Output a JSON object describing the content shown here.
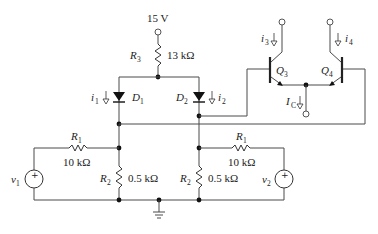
{
  "diagram": {
    "type": "circuit-schematic",
    "supply": {
      "label": "15 V"
    },
    "resistors": {
      "r3": {
        "name": "R",
        "sub": "3",
        "value": "13 kΩ"
      },
      "r1_left": {
        "name": "R",
        "sub": "1",
        "value": "10 kΩ"
      },
      "r1_right": {
        "name": "R",
        "sub": "1",
        "value": "10 kΩ"
      },
      "r2_left": {
        "name": "R",
        "sub": "2",
        "value": "0.5 kΩ"
      },
      "r2_right": {
        "name": "R",
        "sub": "2",
        "value": "0.5 kΩ"
      }
    },
    "diodes": {
      "d1": {
        "name": "D",
        "sub": "1"
      },
      "d2": {
        "name": "D",
        "sub": "2"
      }
    },
    "transistors": {
      "q3": {
        "name": "Q",
        "sub": "3"
      },
      "q4": {
        "name": "Q",
        "sub": "4"
      }
    },
    "currents": {
      "i1": {
        "name": "i",
        "sub": "1"
      },
      "i2": {
        "name": "i",
        "sub": "2"
      },
      "i3": {
        "name": "i",
        "sub": "3"
      },
      "i4": {
        "name": "i",
        "sub": "4"
      },
      "ic": {
        "name": "I",
        "sub": "C"
      }
    },
    "sources": {
      "v1": {
        "name": "v",
        "sub": "1",
        "polarity": "+"
      },
      "v2": {
        "name": "v",
        "sub": "2",
        "polarity": "+"
      }
    },
    "colors": {
      "wire": "#4a4a4a",
      "node": "#111111",
      "background": "#ffffff"
    }
  }
}
